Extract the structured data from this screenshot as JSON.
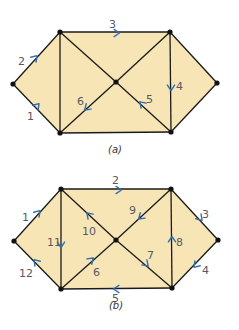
{
  "colors": {
    "fill": "#f8e5b6",
    "edge": "#1a1a1a",
    "arrow": "#2e6fb0",
    "label": "#555a60"
  },
  "diagrams": [
    {
      "id": "a",
      "caption": "(a)",
      "nodes": {
        "L": [
          13,
          84
        ],
        "TL": [
          60,
          32
        ],
        "TR": [
          170,
          32
        ],
        "R": [
          217,
          83
        ],
        "BR": [
          171,
          132
        ],
        "BL": [
          60,
          133
        ],
        "C": [
          116,
          82
        ]
      },
      "edges": [
        [
          "L",
          "TL"
        ],
        [
          "TL",
          "TR"
        ],
        [
          "TR",
          "R"
        ],
        [
          "R",
          "BR"
        ],
        [
          "BR",
          "BL"
        ],
        [
          "BL",
          "L"
        ],
        [
          "TL",
          "BL"
        ],
        [
          "TR",
          "BR"
        ],
        [
          "TL",
          "C"
        ],
        [
          "C",
          "BR"
        ],
        [
          "TR",
          "C"
        ],
        [
          "C",
          "BL"
        ]
      ],
      "arrows": [
        {
          "label": "1",
          "at": [
            36,
            107
          ],
          "dir": [
            1,
            -1.1
          ],
          "lx": 27,
          "ly": 120
        },
        {
          "label": "2",
          "at": [
            34,
            59
          ],
          "dir": [
            1,
            -1.1
          ],
          "lx": 18,
          "ly": 65
        },
        {
          "label": "3",
          "at": [
            115,
            33
          ],
          "dir": [
            1,
            0
          ],
          "lx": 109,
          "ly": 28
        },
        {
          "label": "4",
          "at": [
            171,
            86
          ],
          "dir": [
            0,
            1
          ],
          "lx": 176,
          "ly": 90
        },
        {
          "label": "5",
          "at": [
            143,
            105
          ],
          "dir": [
            -1,
            -1
          ],
          "lx": 146,
          "ly": 103
        },
        {
          "label": "6",
          "at": [
            88,
            107
          ],
          "dir": [
            -1,
            0.9
          ],
          "lx": 77,
          "ly": 105
        }
      ]
    },
    {
      "id": "b",
      "caption": "(b)",
      "nodes": {
        "L": [
          14,
          241
        ],
        "TL": [
          61,
          189
        ],
        "TR": [
          171,
          189
        ],
        "R": [
          218,
          240
        ],
        "BR": [
          172,
          288
        ],
        "BL": [
          61,
          289
        ],
        "C": [
          116,
          240
        ]
      },
      "edges": [
        [
          "L",
          "TL"
        ],
        [
          "TL",
          "TR"
        ],
        [
          "TR",
          "R"
        ],
        [
          "R",
          "BR"
        ],
        [
          "BR",
          "BL"
        ],
        [
          "BL",
          "L"
        ],
        [
          "TL",
          "BL"
        ],
        [
          "TR",
          "BR"
        ],
        [
          "TL",
          "C"
        ],
        [
          "C",
          "BR"
        ],
        [
          "TR",
          "C"
        ],
        [
          "C",
          "BL"
        ]
      ],
      "arrows": [
        {
          "label": "1",
          "at": [
            37,
            214
          ],
          "dir": [
            1,
            -1.1
          ],
          "lx": 22,
          "ly": 221
        },
        {
          "label": "2",
          "at": [
            117,
            190
          ],
          "dir": [
            1,
            0
          ],
          "lx": 112,
          "ly": 184
        },
        {
          "label": "3",
          "at": [
            199,
            217
          ],
          "dir": [
            1,
            1.1
          ],
          "lx": 202,
          "ly": 218
        },
        {
          "label": "4",
          "at": [
            197,
            264
          ],
          "dir": [
            -1,
            1.1
          ],
          "lx": 202,
          "ly": 274
        },
        {
          "label": "5",
          "at": [
            118,
            289
          ],
          "dir": [
            -1,
            0
          ],
          "lx": 112,
          "ly": 302
        },
        {
          "label": "6",
          "at": [
            90,
            261
          ],
          "dir": [
            1,
            -0.9
          ],
          "lx": 93,
          "ly": 276
        },
        {
          "label": "7",
          "at": [
            145,
            263
          ],
          "dir": [
            1,
            1
          ],
          "lx": 147,
          "ly": 259
        },
        {
          "label": "8",
          "at": [
            172,
            241
          ],
          "dir": [
            0,
            -1
          ],
          "lx": 176,
          "ly": 246
        },
        {
          "label": "9",
          "at": [
            142,
            216
          ],
          "dir": [
            -1,
            0.9
          ],
          "lx": 129,
          "ly": 214
        },
        {
          "label": "10",
          "at": [
            90,
            216
          ],
          "dir": [
            -1,
            -1
          ],
          "lx": 82,
          "ly": 235
        },
        {
          "label": "11",
          "at": [
            61,
            243
          ],
          "dir": [
            0,
            1
          ],
          "lx": 47,
          "ly": 246
        },
        {
          "label": "12",
          "at": [
            37,
            263
          ],
          "dir": [
            -1,
            -1.1
          ],
          "lx": 19,
          "ly": 277
        }
      ]
    }
  ]
}
